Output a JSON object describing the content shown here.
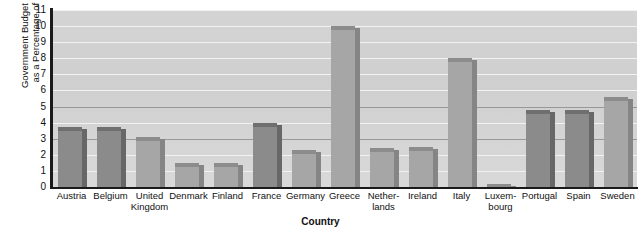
{
  "chart_data": {
    "type": "bar",
    "title": "",
    "xlabel": "Country",
    "ylabel_line1": "Government Budget Deficit",
    "ylabel_line2": "as a Percentage of GDP",
    "ylabel": "Government Budget Deficit as a Percentage of GDP",
    "ylim": [
      0,
      11
    ],
    "yticks": [
      11,
      10,
      9,
      8,
      7,
      6,
      5,
      4,
      3,
      2,
      1,
      0
    ],
    "grid": true,
    "legend": "none",
    "categories": [
      "Austria",
      "Belgium",
      "United Kingdom",
      "Denmark",
      "Finland",
      "France",
      "Germany",
      "Greece",
      "Netherlands",
      "Ireland",
      "Italy",
      "Luxembourg",
      "Portugal",
      "Spain",
      "Sweden"
    ],
    "category_labels": [
      [
        "Austria"
      ],
      [
        "Belgium"
      ],
      [
        "United",
        "Kingdom"
      ],
      [
        "Denmark"
      ],
      [
        "Finland"
      ],
      [
        "France"
      ],
      [
        "Germany"
      ],
      [
        "Greece"
      ],
      [
        "Nether-",
        "lands"
      ],
      [
        "Ireland"
      ],
      [
        "Italy"
      ],
      [
        "Luxem-",
        "bourg"
      ],
      [
        "Portugal"
      ],
      [
        "Spain"
      ],
      [
        "Sweden"
      ]
    ],
    "values": [
      3.7,
      3.7,
      3.1,
      1.5,
      1.5,
      4.0,
      2.3,
      10.0,
      2.4,
      2.5,
      8.0,
      0.2,
      4.8,
      4.8,
      5.6
    ],
    "bar_shades": [
      "dark",
      "dark",
      "light",
      "light",
      "light",
      "dark",
      "light",
      "light",
      "light",
      "light",
      "light",
      "light",
      "dark",
      "dark",
      "light"
    ]
  },
  "colors": {
    "bar_dark_face": "#8b8b8b",
    "bar_dark_top": "#6f6f6f",
    "bar_dark_side": "#676767",
    "bar_light_face": "#a6a6a6",
    "bar_light_top": "#8c8c8c",
    "bar_light_side": "#858585",
    "plot_background": "#d4d4d4",
    "gridline": "#f2f2f2",
    "gridline_major": "#8e8e8e",
    "axis": "#1a1a1a",
    "text": "#111111"
  }
}
